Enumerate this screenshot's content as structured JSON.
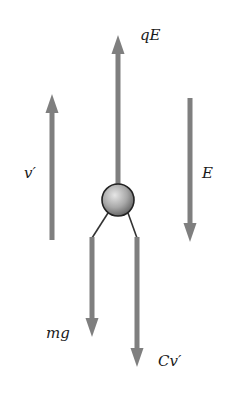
{
  "diagram": {
    "colors": {
      "arrow": "#7f7f7f",
      "leg_line": "#333333",
      "sphere_light": "#d8d8d8",
      "sphere_dark": "#6e6e6e",
      "sphere_outline": "#222222",
      "text": "#1a1a1a"
    },
    "labels": {
      "electric_force": "qE",
      "velocity": "v′",
      "field": "E",
      "weight": "mg",
      "drag": "Cv′"
    },
    "arrows": [
      {
        "id": "electric_force",
        "direction": "up",
        "x": 118,
        "y_from": 184,
        "y_to": 35
      },
      {
        "id": "velocity",
        "direction": "up",
        "x": 52,
        "y_from": 240,
        "y_to": 94
      },
      {
        "id": "field",
        "direction": "down",
        "x": 190,
        "y_from": 98,
        "y_to": 242
      },
      {
        "id": "weight",
        "direction": "down",
        "x": 92,
        "y_from": 237,
        "y_to": 336
      },
      {
        "id": "drag",
        "direction": "down",
        "x": 137,
        "y_from": 237,
        "y_to": 366
      }
    ],
    "particle": {
      "cx": 118,
      "cy": 200,
      "r": 16
    }
  }
}
